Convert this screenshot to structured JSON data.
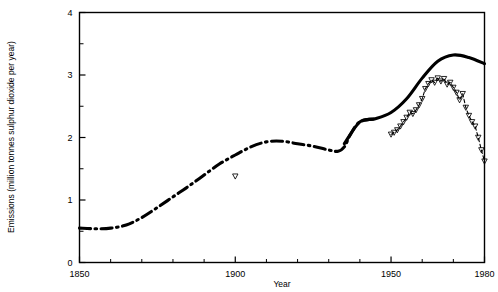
{
  "chart_data": {
    "type": "line",
    "title": "",
    "xlabel": "Year",
    "ylabel": "Emissions (million tonnes sulphur dioxide per year)",
    "xlim": [
      1850,
      1980
    ],
    "ylim": [
      0,
      4
    ],
    "grid": false,
    "legend_position": "none",
    "x_major_ticks": [
      1850,
      1900,
      1950,
      1980
    ],
    "x_major_tick_labels": [
      "1850",
      "1900",
      "1950",
      "1980"
    ],
    "x_minor_ticks": [
      1860,
      1870,
      1880,
      1890,
      1910,
      1920,
      1930,
      1940,
      1960,
      1970
    ],
    "y_major_ticks": [
      0,
      1,
      2,
      3,
      4
    ],
    "y_major_tick_labels": [
      "0",
      "1",
      "2",
      "3",
      "4"
    ],
    "y_minor_ticks": [
      0.5,
      1.5,
      2.5,
      3.5
    ],
    "series": [
      {
        "name": "Estimated total emissions",
        "style": "dash-dot thick black",
        "x": [
          1850,
          1855,
          1860,
          1865,
          1870,
          1875,
          1880,
          1885,
          1890,
          1895,
          1900,
          1905,
          1910,
          1915,
          1920,
          1925,
          1930,
          1933,
          1935,
          1937,
          1940,
          1945
        ],
        "values": [
          0.55,
          0.54,
          0.55,
          0.6,
          0.72,
          0.88,
          1.05,
          1.22,
          1.4,
          1.58,
          1.72,
          1.85,
          1.93,
          1.94,
          1.9,
          1.86,
          1.8,
          1.78,
          1.85,
          2.05,
          2.25,
          2.3
        ]
      },
      {
        "name": "Total emissions (solid)",
        "style": "solid thick black",
        "x": [
          1850,
          1860,
          1870,
          1880,
          1890,
          1900,
          1910,
          1920,
          1930,
          1935,
          1940,
          1945,
          1950,
          1955,
          1960,
          1965,
          1970,
          1975,
          1980
        ],
        "values": [
          0.55,
          0.55,
          0.72,
          1.05,
          1.4,
          1.72,
          1.93,
          1.9,
          1.8,
          1.9,
          2.25,
          2.3,
          2.4,
          2.62,
          2.95,
          3.22,
          3.32,
          3.28,
          3.18
        ]
      },
      {
        "name": "Measured emissions",
        "style": "dashed with open inverted-triangle markers",
        "marker": "inverted-triangle-open",
        "x": [
          1900,
          1950,
          1951,
          1952,
          1953,
          1954,
          1955,
          1956,
          1957,
          1958,
          1959,
          1960,
          1961,
          1962,
          1963,
          1964,
          1965,
          1966,
          1967,
          1968,
          1969,
          1970,
          1971,
          1972,
          1973,
          1974,
          1975,
          1976,
          1977,
          1978,
          1979,
          1980
        ],
        "values": [
          1.38,
          2.05,
          2.08,
          2.12,
          2.18,
          2.25,
          2.32,
          2.4,
          2.38,
          2.44,
          2.52,
          2.62,
          2.78,
          2.86,
          2.92,
          2.88,
          2.95,
          2.9,
          2.94,
          2.85,
          2.88,
          2.8,
          2.72,
          2.6,
          2.7,
          2.48,
          2.35,
          2.25,
          2.18,
          2.0,
          1.8,
          1.62
        ]
      }
    ],
    "annotations": [
      {
        "text": "isolated open triangle marker near 1900",
        "x": 1900,
        "y": 1.38
      }
    ]
  },
  "axis": {
    "x_title": "Year",
    "y_title": "Emissions (million tonnes sulphur dioxide per year)"
  }
}
